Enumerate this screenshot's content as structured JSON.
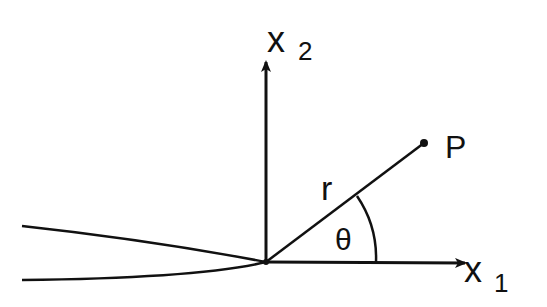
{
  "diagram": {
    "labels": {
      "x1_axis": "x",
      "x1_sub": "1",
      "x2_axis": "x",
      "x2_sub": "2",
      "point": "P",
      "radius": "r",
      "angle": "θ"
    },
    "colors": {
      "ink": "#111111",
      "background": "#ffffff"
    }
  }
}
